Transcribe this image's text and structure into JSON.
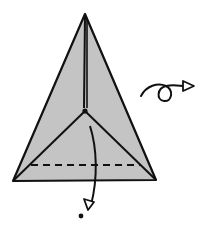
{
  "diagram": {
    "title": "Origami step: fold tip down, then turn over",
    "colors": {
      "paper": "#c4c4c4",
      "line": "#111111",
      "background": "#ffffff"
    },
    "elements": {
      "paper_shape": "triangle",
      "valley_fold": "dashed-line",
      "fold_arrow": "curved-arrow-down",
      "target_point": "dot",
      "turn_over_symbol": "loop-arrow-right"
    }
  }
}
